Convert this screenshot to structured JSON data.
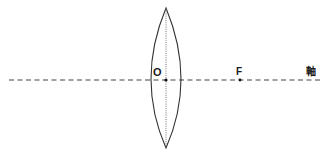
{
  "diagram": {
    "type": "convex-lens-optics",
    "labels": {
      "optical_center": "O",
      "focal_point": "F",
      "axis": "軸"
    },
    "colors": {
      "line": "#333333",
      "background": "#ffffff"
    }
  }
}
